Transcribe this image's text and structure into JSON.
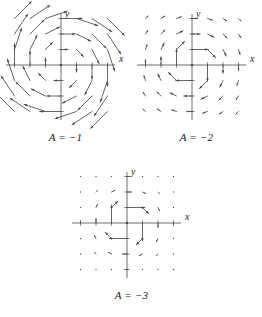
{
  "figure": {
    "kind": "vector-field-panels",
    "panel_count": 3,
    "background": "#ffffff",
    "ink": "#4a4a4a",
    "text_color": "#1a1a1a"
  },
  "chart_data": [
    {
      "type": "scatter",
      "name": "panel-A-minus-1",
      "title": "A = -1",
      "xlabel": "x",
      "ylabel": "y",
      "xlim": [
        -3.5,
        3.5
      ],
      "ylim": [
        -3.5,
        3.5
      ],
      "grid": false,
      "axis_ticks_x": [
        -3,
        -2,
        -1,
        1,
        2,
        3
      ],
      "axis_ticks_y": [
        -3,
        -2,
        -1,
        1,
        2,
        3
      ],
      "field": {
        "description": "clockwise spiral, arrow length grows with radius",
        "magnitude_exponent": 1,
        "rotation": "clockwise",
        "scale": 0.46,
        "grid_x": [
          -3,
          -2,
          -1,
          0,
          1,
          2,
          3
        ],
        "grid_y": [
          -3,
          -2,
          -1,
          0,
          1,
          2,
          3
        ]
      }
    },
    {
      "type": "scatter",
      "name": "panel-A-minus-2",
      "title": "A = -2",
      "xlabel": "x",
      "ylabel": "y",
      "xlim": [
        -3.5,
        3.5
      ],
      "ylim": [
        -3.5,
        3.5
      ],
      "grid": false,
      "axis_ticks_x": [
        -3,
        -2,
        -1,
        1,
        2,
        3
      ],
      "axis_ticks_y": [
        -3,
        -2,
        -1,
        1,
        2,
        3
      ],
      "field": {
        "description": "clockwise spiral, arrow length decays as 1/r",
        "magnitude_exponent": -1,
        "rotation": "clockwise",
        "scale": 1.05,
        "grid_x": [
          -3,
          -2,
          -1,
          0,
          1,
          2,
          3
        ],
        "grid_y": [
          -3,
          -2,
          -1,
          0,
          1,
          2,
          3
        ]
      }
    },
    {
      "type": "scatter",
      "name": "panel-A-minus-3",
      "title": "A = -3",
      "xlabel": "x",
      "ylabel": "y",
      "xlim": [
        -3.5,
        3.5
      ],
      "ylim": [
        -3.5,
        3.5
      ],
      "grid": false,
      "axis_ticks_x": [
        -3,
        -2,
        -1,
        1,
        2,
        3
      ],
      "axis_ticks_y": [
        -3,
        -2,
        -1,
        1,
        2,
        3
      ],
      "field": {
        "description": "clockwise spiral, arrow length decays as 1/r^2; only innermost ring visible",
        "magnitude_exponent": -2,
        "rotation": "clockwise",
        "scale": 1.15,
        "grid_x": [
          -3,
          -2,
          -1,
          0,
          1,
          2,
          3
        ],
        "grid_y": [
          -3,
          -2,
          -1,
          0,
          1,
          2,
          3
        ]
      }
    }
  ],
  "panels": [
    {
      "caption": "A = −1",
      "x_axis_label": "x",
      "y_axis_label": "y"
    },
    {
      "caption": "A = −2",
      "x_axis_label": "x",
      "y_axis_label": "y"
    },
    {
      "caption": "A = −3",
      "x_axis_label": "x",
      "y_axis_label": "y"
    }
  ]
}
